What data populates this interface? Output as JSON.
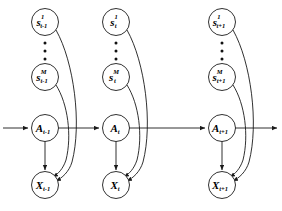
{
  "diagram": {
    "type": "directed-graphical-model",
    "colors": {
      "stroke": "#1a1a1a",
      "node_fill": "#ffffff",
      "background": "#ffffff",
      "text": "#000000"
    },
    "slices": [
      {
        "id": "slice-t-minus-1",
        "time_label": "t-1",
        "sensor_top": {
          "base": "s",
          "sup": "1",
          "sub": "t-1"
        },
        "sensor_bottom": {
          "base": "s",
          "sup": "M",
          "sub": "t-1"
        },
        "state": {
          "base": "A",
          "sup": "",
          "sub": "t-1"
        },
        "observation": {
          "base": "X",
          "sup": "",
          "sub": "t-1"
        },
        "ellipsis_count": 3
      },
      {
        "id": "slice-t",
        "time_label": "t",
        "sensor_top": {
          "base": "s",
          "sup": "1",
          "sub": "t"
        },
        "sensor_bottom": {
          "base": "s",
          "sup": "M",
          "sub": "t"
        },
        "state": {
          "base": "A",
          "sup": "",
          "sub": "t"
        },
        "observation": {
          "base": "X",
          "sup": "",
          "sub": "t"
        },
        "ellipsis_count": 3
      },
      {
        "id": "slice-t-plus-1",
        "time_label": "t+1",
        "sensor_top": {
          "base": "s",
          "sup": "1",
          "sub": "t+1"
        },
        "sensor_bottom": {
          "base": "s",
          "sup": "M",
          "sub": "t+1"
        },
        "state": {
          "base": "A",
          "sup": "",
          "sub": "t+1"
        },
        "observation": {
          "base": "X",
          "sup": "",
          "sub": "t+1"
        },
        "ellipsis_count": 3
      }
    ],
    "edges": {
      "state_chain": "left-to-right horizontal arrows through A nodes, entering from far left and exiting at far right",
      "state_to_observation": "vertical arrow from each A node down to its X node",
      "sensor_to_observation": "curved arrows from each sensor node sweeping right then down into the X node of the same slice"
    }
  }
}
